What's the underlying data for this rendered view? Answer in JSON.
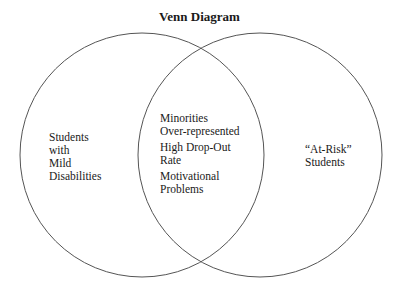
{
  "title": "Venn Diagram",
  "sets": [
    {
      "name": "left",
      "lines": [
        "Students",
        "with",
        "Mild",
        "Disabilities"
      ]
    },
    {
      "name": "right",
      "lines": [
        "“At-Risk”",
        "Students"
      ]
    }
  ],
  "intersection": [
    [
      "Minorities",
      "Over-represented"
    ],
    [
      "High Drop-Out",
      "Rate"
    ],
    [
      "Motivational",
      "Problems"
    ]
  ],
  "colors": {
    "stroke": "#555555",
    "text": "#1a1a1a",
    "background": "#ffffff"
  }
}
